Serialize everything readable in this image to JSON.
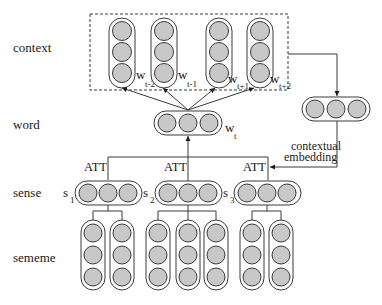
{
  "row_labels": {
    "context": "context",
    "word": "word",
    "sense": "sense",
    "sememe": "sememe"
  },
  "context_words": [
    {
      "base": "w",
      "sub": "t-2"
    },
    {
      "base": "w",
      "sub": "t-1"
    },
    {
      "base": "w",
      "sub": "t+1"
    },
    {
      "base": "w",
      "sub": "t+2"
    }
  ],
  "target_word": {
    "base": "w",
    "sub": "t"
  },
  "senses": [
    {
      "base": "s",
      "sub": "1",
      "att_label": "ATT",
      "sememe_count": 2
    },
    {
      "base": "s",
      "sub": "2",
      "att_label": "ATT",
      "sememe_count": 3
    },
    {
      "base": "s",
      "sub": "3",
      "att_label": "ATT",
      "sememe_count": 2
    }
  ],
  "contextual_embedding": {
    "line1": "contextual",
    "line2": "embedding"
  },
  "colors": {
    "node_fill": "#c8c8c8",
    "stroke": "#3a3a3a",
    "background": "#ffffff"
  }
}
